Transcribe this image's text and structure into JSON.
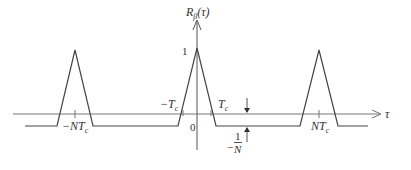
{
  "diagram": {
    "type": "periodic autocorrelation function plot",
    "y_axis_label": {
      "main": "R",
      "sub": "β",
      "arg": "(τ)"
    },
    "x_axis_label": "τ",
    "peak_value_label": "1",
    "origin_label": "0",
    "minus_tc_label": {
      "main": "−T",
      "sub": "c"
    },
    "tc_label": {
      "main": "T",
      "sub": "c"
    },
    "minus_ntc_label": {
      "main": "−NT",
      "sub": "c"
    },
    "ntc_label": {
      "main": "NT",
      "sub": "c"
    },
    "offset_label": {
      "sign": "−",
      "numerator": "1",
      "denominator": "N"
    },
    "colors": {
      "line": "#555555",
      "text": "#333333",
      "background": "#ffffff"
    }
  }
}
